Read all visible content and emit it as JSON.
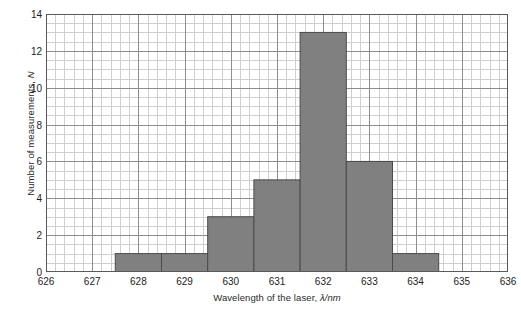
{
  "chart_data": {
    "type": "bar",
    "title": "",
    "subtitle": "",
    "xlabel": "Wavelength of the laser, λ/nm",
    "ylabel": "Number of measurements, N",
    "xlabel_text": "Wavelength of the laser, ",
    "xlabel_symbol": "λ/nm",
    "ylabel_text": "Number of measurements, ",
    "ylabel_symbol": "N",
    "xlim": [
      626,
      636
    ],
    "ylim": [
      0,
      14
    ],
    "grid": true,
    "legend": "none",
    "x_major_step": 1,
    "x_minor_step": 0.2,
    "y_major_step": 2,
    "y_minor_step": 0.5,
    "xticks": [
      626,
      627,
      628,
      629,
      630,
      631,
      632,
      633,
      634,
      635,
      636
    ],
    "xtick_labels": [
      "626",
      "627",
      "628",
      "629",
      "630",
      "631",
      "632",
      "633",
      "634",
      "635",
      "636"
    ],
    "yticks": [
      0,
      2,
      4,
      6,
      8,
      10,
      12,
      14
    ],
    "ytick_labels": [
      "0",
      "2",
      "4",
      "6",
      "8",
      "10",
      "12",
      "14"
    ],
    "bin_width": 1,
    "categories": [
      "628",
      "629",
      "630",
      "631",
      "632",
      "633",
      "634"
    ],
    "values": [
      1,
      1,
      3,
      5,
      13,
      6,
      1
    ],
    "bars": [
      {
        "center": 628,
        "x0": 627.5,
        "x1": 628.5,
        "value": 1
      },
      {
        "center": 629,
        "x0": 628.5,
        "x1": 629.5,
        "value": 1
      },
      {
        "center": 630,
        "x0": 629.5,
        "x1": 630.5,
        "value": 3
      },
      {
        "center": 631,
        "x0": 630.5,
        "x1": 631.5,
        "value": 5
      },
      {
        "center": 632,
        "x0": 631.5,
        "x1": 632.5,
        "value": 13
      },
      {
        "center": 633,
        "x0": 632.5,
        "x1": 633.5,
        "value": 6
      },
      {
        "center": 634,
        "x0": 633.5,
        "x1": 634.5,
        "value": 1
      }
    ]
  },
  "style": {
    "bar_fill": "#808080",
    "bar_stroke": "#4a4a4a",
    "grid_major": "#8d8d8d",
    "grid_minor": "#cfcfcf",
    "frame": "#5a5a5a",
    "background": "#ffffff",
    "text": "#1d1d1d"
  }
}
